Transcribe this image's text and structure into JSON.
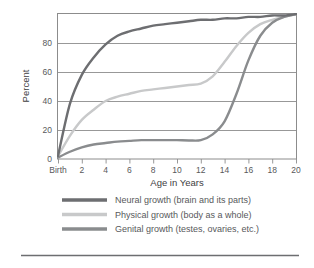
{
  "chart_data": {
    "type": "line",
    "title": "",
    "xlabel": "Age in Years",
    "ylabel": "Percent",
    "xlim": [
      0,
      20
    ],
    "ylim": [
      0,
      100
    ],
    "grid": true,
    "grid_axis": "y",
    "legend_position": "below",
    "x_tick_labels": [
      "Birth",
      "2",
      "4",
      "6",
      "8",
      "10",
      "12",
      "14",
      "16",
      "18",
      "20"
    ],
    "x_tick_values": [
      0,
      2,
      4,
      6,
      8,
      10,
      12,
      14,
      16,
      18,
      20
    ],
    "y_tick_labels": [
      "0",
      "20",
      "40",
      "60",
      "80"
    ],
    "y_tick_values": [
      0,
      20,
      40,
      60,
      80
    ],
    "x": [
      0,
      1,
      2,
      3,
      4,
      5,
      6,
      7,
      8,
      9,
      10,
      11,
      12,
      13,
      14,
      15,
      16,
      17,
      18,
      19,
      20
    ],
    "series": [
      {
        "name": "Neural growth (brain and its parts)",
        "color": "#6d6e71",
        "values": [
          2,
          38,
          58,
          70,
          79,
          85,
          88,
          90,
          92,
          93,
          94,
          95,
          96,
          96,
          97,
          97,
          98,
          98,
          99,
          99,
          100
        ]
      },
      {
        "name": "Physical growth (body as a whole)",
        "color": "#c8c9ca",
        "values": [
          2,
          16,
          27,
          34,
          40,
          43,
          45,
          47,
          48,
          49,
          50,
          51,
          52,
          57,
          67,
          78,
          87,
          93,
          96,
          98,
          100
        ]
      },
      {
        "name": "Genital growth (testes, ovaries, etc.)",
        "color": "#8a8c8e",
        "values": [
          1,
          5,
          8,
          10,
          11,
          12,
          12.5,
          13,
          13,
          13,
          13,
          12.8,
          13,
          17,
          26,
          45,
          68,
          85,
          94,
          98,
          100
        ]
      }
    ]
  },
  "legend": {
    "items": [
      {
        "label": "Neural growth (brain and its parts)",
        "color": "#6d6e71"
      },
      {
        "label": "Physical growth (body as a whole)",
        "color": "#c8c9ca"
      },
      {
        "label": "Genital growth (testes, ovaries, etc.)",
        "color": "#8a8c8e"
      }
    ]
  },
  "colors": {
    "frame": "#8c8c8c",
    "gridline": "#8c8c8c",
    "rule": "#6d6e71",
    "text": "#58595b"
  }
}
